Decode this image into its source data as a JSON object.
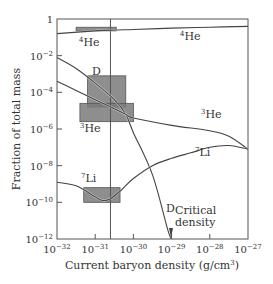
{
  "chart_data": {
    "type": "line",
    "title": "",
    "xlabel": "Current baryon density (g/cm3)",
    "xlabel_parts": {
      "main": "Current baryon density (g/cm",
      "sup": "3",
      "end": ")"
    },
    "ylabel": "Fraction of total mass",
    "x_scale": "log",
    "y_scale": "log",
    "xlim": [
      1e-32,
      1e-27
    ],
    "ylim": [
      1e-12,
      1
    ],
    "grid": false,
    "x_ticks": [
      {
        "base": "10",
        "exp": "−32"
      },
      {
        "base": "10",
        "exp": "−31"
      },
      {
        "base": "10",
        "exp": "−30"
      },
      {
        "base": "10",
        "exp": "−29"
      },
      {
        "base": "10",
        "exp": "−28"
      },
      {
        "base": "10",
        "exp": "−27"
      }
    ],
    "y_ticks": [
      {
        "base": "1",
        "exp": ""
      },
      {
        "base": "10",
        "exp": "−2"
      },
      {
        "base": "10",
        "exp": "−4"
      },
      {
        "base": "10",
        "exp": "−6"
      },
      {
        "base": "10",
        "exp": "−8"
      },
      {
        "base": "10",
        "exp": "−10"
      },
      {
        "base": "10",
        "exp": "−12"
      }
    ],
    "series": [
      {
        "name": "4He",
        "label_sup": "4",
        "label_main": "He",
        "log_x": [
          -32,
          -31,
          -30.5,
          -30,
          -29,
          -28,
          -27
        ],
        "log_y": [
          -0.8,
          -0.65,
          -0.6,
          -0.57,
          -0.5,
          -0.45,
          -0.4
        ]
      },
      {
        "name": "D",
        "label_sup": "",
        "label_main": "D",
        "log_x": [
          -32,
          -31.5,
          -31,
          -30.5,
          -30.2,
          -30,
          -29.5,
          -29.1,
          -29
        ],
        "log_y": [
          -2.1,
          -2.7,
          -3.5,
          -4.4,
          -5.2,
          -6.2,
          -8.5,
          -11.5,
          -12
        ]
      },
      {
        "name": "3He",
        "label_sup": "3",
        "label_main": "He",
        "log_x": [
          -32,
          -31.5,
          -31,
          -30.5,
          -30.2,
          -30,
          -29,
          -28,
          -27.5,
          -27
        ],
        "log_y": [
          -3.4,
          -3.9,
          -4.4,
          -4.9,
          -5.2,
          -5.4,
          -5.8,
          -6.1,
          -6.4,
          -7.1
        ]
      },
      {
        "name": "7Li",
        "label_sup": "7",
        "label_main": "Li",
        "log_x": [
          -32,
          -31.5,
          -31,
          -30.8,
          -30.6,
          -30.3,
          -30,
          -29.5,
          -29,
          -28.5,
          -28,
          -27.5,
          -27
        ],
        "log_y": [
          -8.9,
          -9.1,
          -9.7,
          -9.9,
          -9.8,
          -9.3,
          -8.7,
          -8.0,
          -7.6,
          -7.3,
          -7.0,
          -6.9,
          -7.1
        ]
      }
    ],
    "annotations": {
      "observed_boxes": [
        {
          "species": "4He",
          "log_x": [
            -31.5,
            -30.45
          ],
          "log_y": [
            -0.45,
            -0.65
          ]
        },
        {
          "species": "D",
          "log_x": [
            -31.2,
            -30.2
          ],
          "log_y": [
            -3.1,
            -4.8
          ]
        },
        {
          "species": "3He",
          "log_x": [
            -31.4,
            -30.0
          ],
          "log_y": [
            -4.6,
            -5.6
          ]
        },
        {
          "species": "7Li",
          "log_x": [
            -31.3,
            -30.35
          ],
          "log_y": [
            -9.2,
            -10.0
          ]
        }
      ],
      "vertical_line_log_x": -30.6,
      "critical_density_label": [
        "Critical",
        "density"
      ],
      "critical_density_log_x": -29.05
    }
  }
}
